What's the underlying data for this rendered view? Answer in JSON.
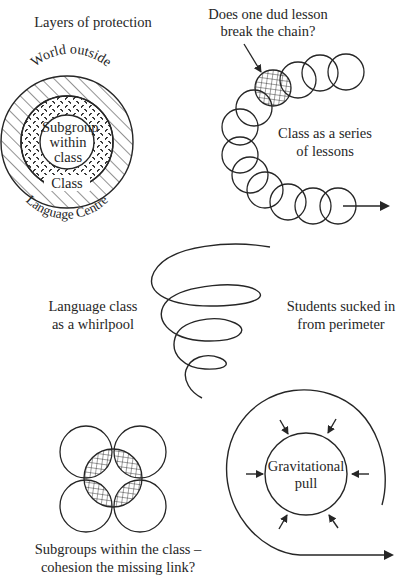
{
  "panels": {
    "layers": {
      "title": "Layers of protection",
      "outer_label": "World outside",
      "ring1_label": "Language Centre",
      "ring2_label": "Class",
      "core_label_lines": [
        "Subgroup",
        "within",
        "class"
      ]
    },
    "chain": {
      "question_lines": [
        "Does one dud lesson",
        "break the chain?"
      ],
      "caption_lines": [
        "Class as a series",
        "of lessons"
      ]
    },
    "whirlpool": {
      "left_caption_lines": [
        "Language class",
        "as a whirlpool"
      ],
      "right_caption_lines": [
        "Students sucked in",
        "from perimeter"
      ]
    },
    "subgroups": {
      "caption_lines": [
        "Subgroups within the class –",
        "cohesion the missing link?"
      ]
    },
    "gravity": {
      "center_label_lines": [
        "Gravitational",
        "pull"
      ]
    }
  },
  "colors": {
    "ink": "#262626",
    "background": "#ffffff"
  }
}
